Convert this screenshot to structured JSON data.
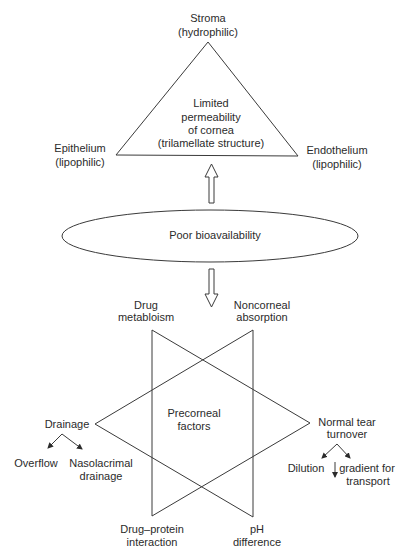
{
  "triangle": {
    "apex_label": [
      "Stroma",
      "(hydrophilic)"
    ],
    "left_label": [
      "Epithelium",
      "(lipophilic)"
    ],
    "right_label": [
      "Endothelium",
      "(lipophilic)"
    ],
    "center_label": [
      "Limited",
      "permeability",
      "of  cornea",
      "(trilamellate structure)"
    ]
  },
  "ellipse": {
    "label": "Poor  bioavailability"
  },
  "star": {
    "center_label": [
      "Precorneal",
      "factors"
    ],
    "top_left": [
      "Drug",
      "metabloism"
    ],
    "top_right": [
      "Noncorneal",
      "absorption"
    ],
    "left": {
      "label": "Drainage",
      "children": [
        "Overflow",
        "Nasolacrimal",
        "drainage"
      ]
    },
    "right": {
      "label": [
        "Normal tear",
        "turnover"
      ],
      "children": [
        "Dilution",
        "gradient for",
        "transport"
      ]
    },
    "bottom_left": [
      "Drug–protein",
      "interaction"
    ],
    "bottom_right": [
      "pH",
      "difference"
    ]
  }
}
